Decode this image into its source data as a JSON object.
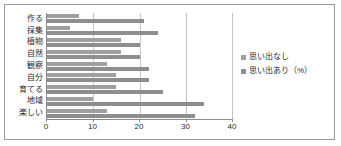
{
  "chart_data": {
    "type": "bar",
    "orientation": "horizontal",
    "title": "",
    "xlabel": "",
    "ylabel": "",
    "xlim": [
      0,
      40
    ],
    "xticks": [
      0,
      10,
      20,
      30,
      40
    ],
    "grid": true,
    "legend_position": "right",
    "categories": [
      "作る",
      "採集",
      "植物",
      "自然",
      "観察",
      "自分",
      "育てる",
      "地域",
      "楽しい"
    ],
    "series": [
      {
        "name": "思い出なし",
        "color": "#a0a0a0",
        "values": [
          7,
          5,
          16,
          16,
          13,
          15,
          15,
          10,
          13
        ]
      },
      {
        "name": "思い出あり（%）",
        "color": "#8e8e8e",
        "values": [
          21,
          24,
          20,
          20,
          22,
          22,
          25,
          34,
          32
        ]
      }
    ]
  },
  "legend": {
    "items": [
      {
        "label": "思い出なし",
        "swatch_class": "series-nashi"
      },
      {
        "label": "思い出あり（%）",
        "swatch_class": "series-ari"
      }
    ]
  },
  "colors": {
    "frame_border": "#9a9a9a",
    "axis": "#8a8a8a",
    "gridline": "#c4c4c4",
    "text": "#2b2b2b",
    "background": "#ffffff"
  }
}
